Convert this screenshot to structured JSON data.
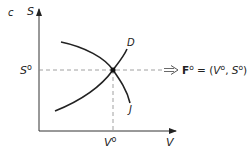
{
  "panel_label": "c",
  "axes": {
    "y_label": "S",
    "x_label": "V"
  },
  "equilibrium": {
    "s_tick_label_base": "S",
    "s_tick_label_sup": "o",
    "v_tick_label_base": "V",
    "v_tick_label_sup": "o"
  },
  "curves": {
    "demand_label": "D",
    "j_label": "J"
  },
  "equation": {
    "f_base": "F",
    "f_sup": "o",
    "equals": " = (",
    "v_base": "V",
    "v_sup": "o",
    "sep": ", ",
    "s_base": "S",
    "s_sup": "o",
    "close": ")"
  },
  "colors": {
    "ink": "#222222",
    "dash": "#888888"
  }
}
